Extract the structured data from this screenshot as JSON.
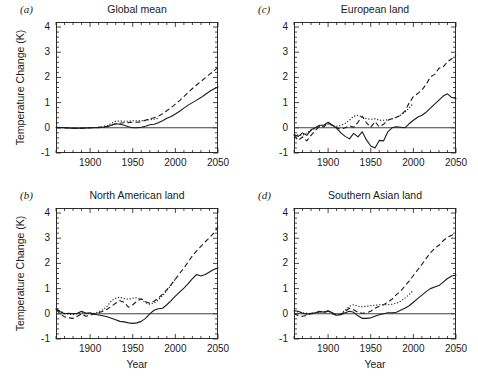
{
  "figure": {
    "axis_label_y": "Temperature Change (K)",
    "axis_label_x": "Year"
  },
  "panels": [
    {
      "tag": "(a)",
      "title": "Global mean",
      "show_ylabel": true,
      "show_xlabel": false
    },
    {
      "tag": "(b)",
      "title": "North American land",
      "show_ylabel": true,
      "show_xlabel": true
    },
    {
      "tag": "(c)",
      "title": "European land",
      "show_ylabel": false,
      "show_xlabel": false
    },
    {
      "tag": "(d)",
      "title": "Southern Asian land",
      "show_ylabel": false,
      "show_xlabel": true
    }
  ],
  "ticks": {
    "y_labels": [
      "4",
      "3",
      "2",
      "1",
      "0",
      "-1"
    ],
    "y_values": [
      4,
      3,
      2,
      1,
      0,
      -1
    ],
    "x_labels": [
      "1900",
      "1950",
      "2000",
      "2050"
    ],
    "x_values": [
      1900,
      1950,
      2000,
      2050
    ],
    "x_minor_step": 10,
    "y_minor_step": 0.2
  },
  "chart_data": {
    "type": "line",
    "xlabel": "Year",
    "ylabel": "Temperature Change (K)",
    "xlim": [
      1860,
      2050
    ],
    "ylim": [
      -1,
      4.2
    ],
    "grid": false,
    "legend_position": "none",
    "panels": [
      {
        "tag": "(a)",
        "title": "Global mean",
        "series": [
          {
            "name": "observed-solid",
            "style": "solid",
            "x": [
              1860,
              1870,
              1880,
              1890,
              1900,
              1910,
              1920,
              1925,
              1930,
              1935,
              1940,
              1945,
              1950,
              1955,
              1960,
              1965,
              1970,
              1975,
              1980,
              1985,
              1990,
              1995,
              2000,
              2005,
              2010,
              2015,
              2020,
              2025,
              2030,
              2035,
              2040,
              2045,
              2050
            ],
            "y": [
              0.02,
              0.0,
              -0.02,
              -0.02,
              0.0,
              0.0,
              0.04,
              0.1,
              0.16,
              0.14,
              0.1,
              0.04,
              0.0,
              0.0,
              0.02,
              0.06,
              0.12,
              0.14,
              0.2,
              0.28,
              0.38,
              0.45,
              0.55,
              0.66,
              0.78,
              0.9,
              1.0,
              1.1,
              1.2,
              1.32,
              1.44,
              1.54,
              1.62
            ]
          },
          {
            "name": "scenario-dashed",
            "style": "dashed",
            "x": [
              1860,
              1870,
              1880,
              1890,
              1900,
              1910,
              1920,
              1930,
              1940,
              1950,
              1955,
              1960,
              1965,
              1970,
              1975,
              1980,
              1985,
              1990,
              1995,
              2000,
              2005,
              2010,
              2015,
              2020,
              2025,
              2030,
              2035,
              2040,
              2045,
              2050
            ],
            "y": [
              0.0,
              0.0,
              -0.02,
              -0.02,
              0.0,
              0.02,
              0.06,
              0.16,
              0.2,
              0.22,
              0.22,
              0.24,
              0.3,
              0.36,
              0.4,
              0.46,
              0.56,
              0.68,
              0.8,
              0.94,
              1.08,
              1.24,
              1.4,
              1.56,
              1.7,
              1.84,
              1.98,
              2.12,
              2.26,
              2.4
            ]
          },
          {
            "name": "scenario-dotted",
            "style": "dotted",
            "x": [
              1860,
              1870,
              1880,
              1890,
              1900,
              1910,
              1920,
              1925,
              1930,
              1935,
              1940,
              1945,
              1950,
              1955,
              1960,
              1965,
              1970,
              1975,
              1980
            ],
            "y": [
              0.0,
              0.0,
              -0.02,
              -0.02,
              0.0,
              0.02,
              0.08,
              0.18,
              0.26,
              0.27,
              0.26,
              0.26,
              0.28,
              0.28,
              0.28,
              0.3,
              0.32,
              0.34,
              0.38
            ]
          }
        ]
      },
      {
        "tag": "(b)",
        "title": "North American land",
        "series": [
          {
            "name": "observed-solid",
            "style": "solid",
            "x": [
              1860,
              1865,
              1870,
              1875,
              1880,
              1885,
              1890,
              1895,
              1900,
              1905,
              1910,
              1915,
              1920,
              1925,
              1930,
              1935,
              1940,
              1945,
              1950,
              1955,
              1960,
              1965,
              1970,
              1975,
              1980,
              1985,
              1990,
              1995,
              2000,
              2005,
              2010,
              2015,
              2020,
              2025,
              2030,
              2035,
              2040,
              2045,
              2050
            ],
            "y": [
              0.2,
              0.08,
              0.0,
              0.02,
              0.0,
              0.02,
              0.1,
              0.02,
              0.04,
              -0.02,
              -0.05,
              -0.08,
              -0.12,
              -0.18,
              -0.24,
              -0.3,
              -0.32,
              -0.36,
              -0.38,
              -0.36,
              -0.3,
              -0.18,
              0.0,
              0.14,
              0.2,
              0.22,
              0.36,
              0.52,
              0.7,
              0.86,
              1.02,
              1.2,
              1.4,
              1.56,
              1.5,
              1.56,
              1.66,
              1.76,
              1.82
            ]
          },
          {
            "name": "scenario-dashed",
            "style": "dashed",
            "x": [
              1860,
              1865,
              1870,
              1875,
              1880,
              1885,
              1890,
              1895,
              1900,
              1905,
              1910,
              1915,
              1920,
              1925,
              1930,
              1935,
              1940,
              1945,
              1950,
              1955,
              1960,
              1965,
              1970,
              1975,
              1980,
              1985,
              1990,
              1995,
              2000,
              2005,
              2010,
              2015,
              2020,
              2025,
              2030,
              2035,
              2040,
              2045,
              2050
            ],
            "y": [
              0.18,
              0.0,
              -0.12,
              -0.16,
              -0.18,
              -0.1,
              0.0,
              -0.1,
              -0.06,
              0.0,
              0.04,
              0.1,
              0.18,
              0.3,
              0.42,
              0.52,
              0.46,
              0.26,
              0.36,
              0.5,
              0.6,
              0.48,
              0.42,
              0.5,
              0.62,
              0.78,
              0.96,
              1.16,
              1.38,
              1.6,
              1.82,
              2.06,
              2.3,
              2.5,
              2.68,
              2.86,
              3.02,
              3.2,
              3.45
            ]
          },
          {
            "name": "scenario-dotted",
            "style": "dotted",
            "x": [
              1860,
              1870,
              1880,
              1890,
              1900,
              1905,
              1910,
              1915,
              1920,
              1925,
              1930,
              1935,
              1940,
              1945,
              1950,
              1955,
              1960,
              1965,
              1970,
              1975,
              1980,
              1985,
              1990,
              1995,
              2000
            ],
            "y": [
              0.18,
              0.02,
              -0.04,
              0.06,
              0.0,
              0.02,
              0.08,
              0.16,
              0.3,
              0.52,
              0.62,
              0.66,
              0.6,
              0.58,
              0.62,
              0.64,
              0.58,
              0.44,
              0.38,
              0.42,
              0.56,
              0.72,
              0.92,
              1.14,
              1.38
            ]
          }
        ]
      },
      {
        "tag": "(c)",
        "title": "European land",
        "series": [
          {
            "name": "observed-solid",
            "style": "solid",
            "x": [
              1860,
              1865,
              1870,
              1875,
              1880,
              1885,
              1890,
              1895,
              1900,
              1905,
              1910,
              1915,
              1920,
              1925,
              1930,
              1935,
              1940,
              1945,
              1950,
              1955,
              1960,
              1965,
              1970,
              1975,
              1980,
              1985,
              1990,
              1995,
              2000,
              2005,
              2010,
              2015,
              2020,
              2025,
              2030,
              2035,
              2040,
              2045,
              2050
            ],
            "y": [
              -0.28,
              -0.34,
              -0.2,
              -0.3,
              -0.08,
              0.0,
              0.1,
              0.1,
              0.22,
              0.1,
              -0.02,
              -0.2,
              -0.34,
              -0.44,
              -0.22,
              -0.36,
              -0.16,
              -0.48,
              -0.72,
              -0.8,
              -0.5,
              -0.52,
              -0.16,
              0.0,
              0.04,
              0.02,
              0.0,
              0.16,
              0.3,
              0.42,
              0.5,
              0.62,
              0.78,
              0.94,
              1.1,
              1.26,
              1.35,
              1.2,
              1.16
            ]
          },
          {
            "name": "scenario-dashed",
            "style": "dashed",
            "x": [
              1860,
              1865,
              1870,
              1875,
              1880,
              1885,
              1890,
              1895,
              1900,
              1905,
              1910,
              1915,
              1920,
              1925,
              1930,
              1935,
              1940,
              1945,
              1950,
              1955,
              1960,
              1965,
              1970,
              1975,
              1980,
              1985,
              1990,
              1995,
              2000,
              2005,
              2010,
              2015,
              2020,
              2025,
              2030,
              2035,
              2040,
              2045,
              2050
            ],
            "y": [
              -0.3,
              -0.5,
              -0.36,
              -0.52,
              -0.3,
              -0.1,
              0.06,
              0.04,
              0.2,
              0.1,
              0.0,
              -0.06,
              0.0,
              0.08,
              0.02,
              0.22,
              0.46,
              0.2,
              0.02,
              0.24,
              0.04,
              0.14,
              0.3,
              0.36,
              0.42,
              0.5,
              0.66,
              0.98,
              1.24,
              1.36,
              1.5,
              1.72,
              2.02,
              2.12,
              2.36,
              2.42,
              2.62,
              2.74,
              2.88
            ]
          },
          {
            "name": "scenario-dotted",
            "style": "dotted",
            "x": [
              1860,
              1870,
              1880,
              1890,
              1900,
              1905,
              1910,
              1915,
              1920,
              1925,
              1930,
              1935,
              1940,
              1945,
              1950,
              1955,
              1960,
              1965,
              1970,
              1975,
              1980,
              1985,
              1990,
              1995,
              2000
            ],
            "y": [
              -0.28,
              -0.3,
              -0.1,
              0.06,
              0.14,
              0.1,
              0.06,
              0.1,
              0.18,
              0.3,
              0.46,
              0.5,
              0.42,
              0.36,
              0.34,
              0.36,
              0.3,
              0.3,
              0.32,
              0.36,
              0.42,
              0.5,
              0.62,
              0.78,
              0.98
            ]
          }
        ]
      },
      {
        "tag": "(d)",
        "title": "Southern Asian land",
        "series": [
          {
            "name": "observed-solid",
            "style": "solid",
            "x": [
              1860,
              1865,
              1870,
              1875,
              1880,
              1885,
              1890,
              1895,
              1900,
              1905,
              1910,
              1915,
              1920,
              1925,
              1930,
              1935,
              1940,
              1945,
              1950,
              1955,
              1960,
              1965,
              1970,
              1975,
              1980,
              1985,
              1990,
              1995,
              2000,
              2005,
              2010,
              2015,
              2020,
              2025,
              2030,
              2035,
              2040,
              2045,
              2050
            ],
            "y": [
              0.12,
              0.1,
              0.02,
              -0.02,
              0.02,
              0.04,
              0.1,
              0.06,
              0.12,
              0.04,
              -0.06,
              -0.04,
              0.04,
              0.1,
              0.06,
              -0.08,
              -0.18,
              -0.18,
              -0.16,
              -0.1,
              -0.04,
              0.0,
              0.04,
              0.04,
              0.06,
              0.14,
              0.22,
              0.32,
              0.46,
              0.6,
              0.74,
              0.88,
              1.0,
              1.06,
              1.12,
              1.26,
              1.4,
              1.5,
              1.54
            ]
          },
          {
            "name": "scenario-dashed",
            "style": "dashed",
            "x": [
              1860,
              1865,
              1870,
              1875,
              1880,
              1885,
              1890,
              1895,
              1900,
              1905,
              1910,
              1915,
              1920,
              1925,
              1930,
              1935,
              1940,
              1945,
              1950,
              1955,
              1960,
              1965,
              1970,
              1975,
              1980,
              1985,
              1990,
              1995,
              2000,
              2005,
              2010,
              2015,
              2020,
              2025,
              2030,
              2035,
              2040,
              2045,
              2050
            ],
            "y": [
              0.02,
              -0.08,
              -0.1,
              -0.06,
              0.0,
              0.02,
              0.08,
              0.04,
              0.1,
              0.0,
              -0.06,
              -0.02,
              0.1,
              0.22,
              0.16,
              0.06,
              0.02,
              0.04,
              0.1,
              0.22,
              0.3,
              0.36,
              0.46,
              0.58,
              0.76,
              0.9,
              1.1,
              1.3,
              1.52,
              1.74,
              1.96,
              2.2,
              2.42,
              2.6,
              2.72,
              2.9,
              3.04,
              3.12,
              3.22
            ]
          },
          {
            "name": "scenario-dotted",
            "style": "dotted",
            "x": [
              1860,
              1870,
              1880,
              1890,
              1900,
              1905,
              1910,
              1915,
              1920,
              1925,
              1930,
              1935,
              1940,
              1945,
              1950,
              1955,
              1960,
              1965,
              1970,
              1975,
              1980,
              1985,
              1990,
              1995,
              2000
            ],
            "y": [
              0.1,
              0.04,
              0.0,
              0.08,
              0.1,
              0.02,
              -0.04,
              0.0,
              0.14,
              0.3,
              0.36,
              0.3,
              0.28,
              0.3,
              0.32,
              0.34,
              0.36,
              0.36,
              0.36,
              0.38,
              0.42,
              0.5,
              0.62,
              0.76,
              0.94
            ]
          }
        ]
      }
    ]
  }
}
